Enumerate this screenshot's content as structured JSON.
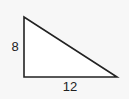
{
  "diagram": {
    "type": "right-triangle",
    "vertices": {
      "top": [
        24,
        17
      ],
      "bottom_left": [
        24,
        77
      ],
      "bottom_right": [
        117,
        77
      ]
    },
    "labels": {
      "vertical_leg": "8",
      "horizontal_leg": "12"
    },
    "colors": {
      "stroke": "#222222",
      "fill": "#ffffff",
      "background": "#f7f7f7"
    }
  }
}
